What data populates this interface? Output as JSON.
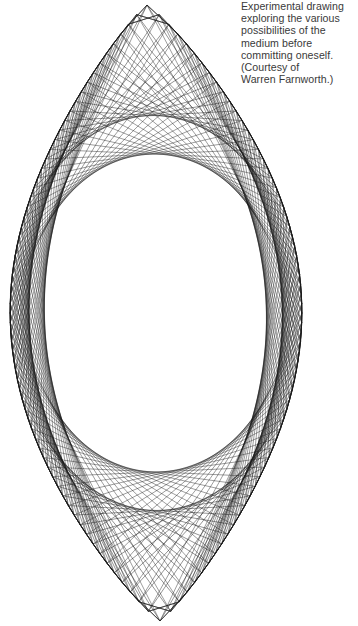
{
  "caption": {
    "lines": [
      "Experimental drawing",
      "exploring the various",
      "possibilities of the",
      "medium before",
      "committing oneself.",
      "(Courtesy of",
      "Warren Farnworth.)"
    ]
  },
  "drawing": {
    "description": "String-art line drawing: lens (vesica) shaped outline with zigzag edge formed by straight chords; dense crossing lines create an inner elliptical envelope leaving a blank oval at the center.",
    "line_color": "#1a1a1a",
    "top_apex": [
      147,
      5
    ],
    "bottom_apex": [
      160,
      621
    ],
    "left_extent_x": 10,
    "right_extent_x": 302,
    "mid_y": 312,
    "points_per_side": 64,
    "chord_steps": [
      23,
      31
    ],
    "inner_oval": {
      "cx": 155,
      "cy": 315,
      "rx": 67,
      "ry": 97
    }
  }
}
